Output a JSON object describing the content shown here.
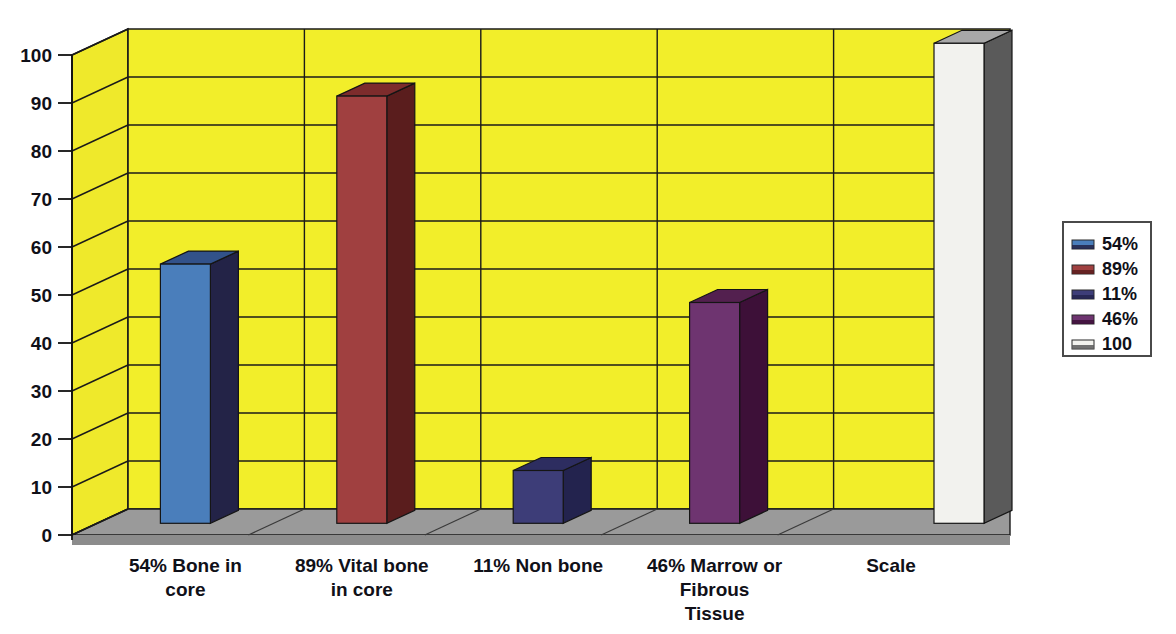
{
  "chart_data": {
    "type": "bar",
    "title": "",
    "subtitle": "",
    "xlabel": "",
    "ylabel": "",
    "categories": [
      "54% Bone in core",
      "89% Vital bone in core",
      "11% Non bone",
      "46% Marrow or Fibrous Tissue",
      "Scale"
    ],
    "category_lines": [
      [
        "54% Bone in",
        "core"
      ],
      [
        "89% Vital bone",
        "in core"
      ],
      [
        "11% Non bone"
      ],
      [
        "46% Marrow or",
        "Fibrous",
        "Tissue"
      ],
      [
        "Scale"
      ]
    ],
    "values": [
      54,
      89,
      11,
      46,
      100
    ],
    "ylim": [
      0,
      100
    ],
    "yticks": [
      0,
      10,
      20,
      30,
      40,
      50,
      60,
      70,
      80,
      90,
      100
    ],
    "ytick_labels": [
      "0",
      "10",
      "20",
      "30",
      "40",
      "50",
      "60",
      "70",
      "80",
      "90",
      "100"
    ],
    "grid": true,
    "three_d": true,
    "legend_position": "right",
    "legend": [
      {
        "label": "54%",
        "color": "#4a7ebb",
        "side_color": "#232347"
      },
      {
        "label": "89%",
        "color": "#a04040",
        "side_color": "#5a1d1d"
      },
      {
        "label": "11%",
        "color": "#3d3d78",
        "side_color": "#23234e"
      },
      {
        "label": "46%",
        "color": "#6e3470",
        "side_color": "#3d1038"
      },
      {
        "label": "100",
        "color": "#f2f2ee",
        "side_color": "#5a5a5a"
      }
    ],
    "series": [
      {
        "name": "values",
        "points": [
          {
            "category": "54% Bone in core",
            "value": 54,
            "color": "#4a7ebb",
            "side_color": "#232347",
            "top_color": "#32528a"
          },
          {
            "category": "89% Vital bone in core",
            "value": 89,
            "color": "#a04040",
            "side_color": "#5a1d1d",
            "top_color": "#7d2c2c"
          },
          {
            "category": "11% Non bone",
            "value": 11,
            "color": "#3d3d78",
            "side_color": "#23234e",
            "top_color": "#2d2d60"
          },
          {
            "category": "46% Marrow or Fibrous Tissue",
            "value": 46,
            "color": "#6e3470",
            "side_color": "#3d1038",
            "top_color": "#53204f"
          },
          {
            "category": "Scale",
            "value": 100,
            "color": "#f2f2ee",
            "side_color": "#5a5a5a",
            "top_color": "#a8a8a8"
          }
        ]
      }
    ],
    "colors": {
      "back_wall": "#f2ee2a",
      "side_wall": "#efe92b",
      "floor": "#9a9a9a",
      "floor_front": "#8c8c8c",
      "gridline": "#1a1a1a",
      "axis": "#101010",
      "legend_border": "#4a4a4a",
      "background": "#ffffff"
    }
  }
}
